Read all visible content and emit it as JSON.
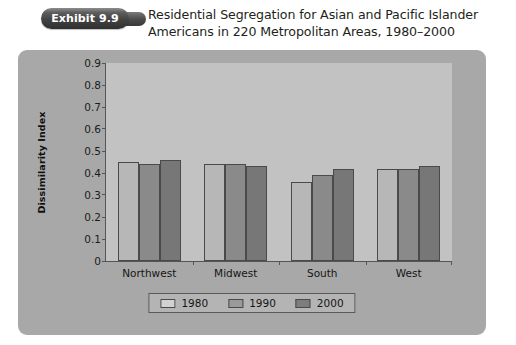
{
  "header": {
    "exhibit_badge": "Exhibit 9.9",
    "title_line1": "Residential Segregation for Asian and Pacific Islander",
    "title_line2": "Americans in 220 Metropolitan Areas, 1980–2000"
  },
  "colors": {
    "panel_background": "#a8a8a8",
    "plot_background": "#c2c2c2",
    "series_1980": "#b7b7b7",
    "series_1990": "#8a8a8a",
    "series_2000": "#777777",
    "axis": "#555555",
    "badge_dark": "#2f2f2f",
    "text": "#231f20"
  },
  "chart_data": {
    "type": "bar",
    "title": "Residential Segregation for Asian and Pacific Islander Americans in 220 Metropolitan Areas, 1980–2000",
    "xlabel": "",
    "ylabel": "Dissimilarity Index",
    "categories": [
      "Northwest",
      "Midwest",
      "South",
      "West"
    ],
    "series": [
      {
        "name": "1980",
        "values": [
          0.45,
          0.44,
          0.36,
          0.42
        ]
      },
      {
        "name": "1990",
        "values": [
          0.44,
          0.44,
          0.39,
          0.42
        ]
      },
      {
        "name": "2000",
        "values": [
          0.46,
          0.43,
          0.42,
          0.43
        ]
      }
    ],
    "ylim": [
      0,
      0.9
    ],
    "ytick_labels": [
      "0.9",
      "0.8",
      "0.7",
      "0.6",
      "0.5",
      "0.4",
      "0.3",
      "0.2",
      "0.1",
      "0"
    ],
    "ytick_values": [
      0.9,
      0.8,
      0.7,
      0.6,
      0.5,
      0.4,
      0.3,
      0.2,
      0.1,
      0
    ],
    "grid": false,
    "legend_position": "bottom"
  }
}
